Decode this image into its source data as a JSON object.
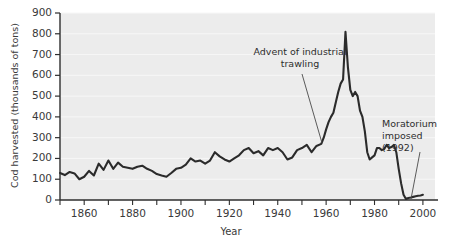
{
  "chart_data": {
    "type": "line",
    "title": "",
    "xlabel": "Year",
    "ylabel": "Cod harvested (thousands of tons)",
    "xlim": [
      1850,
      2005
    ],
    "ylim": [
      0,
      900
    ],
    "ytick_labels": [
      "0",
      "100",
      "200",
      "300",
      "400",
      "500",
      "600",
      "700",
      "800",
      "900"
    ],
    "ytick_values": [
      0,
      100,
      200,
      300,
      400,
      500,
      600,
      700,
      800,
      900
    ],
    "xtick_labels": [
      "1860",
      "1880",
      "1900",
      "1920",
      "1940",
      "1960",
      "1980",
      "2000"
    ],
    "xtick_values": [
      1860,
      1880,
      1900,
      1920,
      1940,
      1960,
      1980,
      2000
    ],
    "xminor_step": 10,
    "grid": "horizontal-faint",
    "legend": "none",
    "line_color": "#2b2b2b",
    "background_color": "#ececec",
    "gridline_color": "#f7f7f7",
    "annotations": [
      {
        "id": "advent-of-industrial-trawling",
        "text_line1": "Advent of industrial",
        "text_line2": "trawling",
        "points_to_year": 1955,
        "points_to_value": 210
      },
      {
        "id": "moratorium-imposed",
        "text_line1": "Moratorium",
        "text_line2": "imposed",
        "text_line3": "(1992)",
        "points_to_year": 1992,
        "points_to_value": 0
      }
    ],
    "series": [
      {
        "name": "Cod harvested",
        "x": [
          1850,
          1852,
          1854,
          1856,
          1858,
          1860,
          1862,
          1864,
          1866,
          1868,
          1870,
          1872,
          1874,
          1876,
          1878,
          1880,
          1882,
          1884,
          1886,
          1888,
          1890,
          1892,
          1894,
          1896,
          1898,
          1900,
          1902,
          1904,
          1906,
          1908,
          1910,
          1912,
          1914,
          1916,
          1918,
          1920,
          1922,
          1924,
          1926,
          1928,
          1930,
          1932,
          1934,
          1936,
          1938,
          1940,
          1942,
          1944,
          1946,
          1948,
          1950,
          1952,
          1954,
          1956,
          1958,
          1959,
          1960,
          1961,
          1962,
          1963,
          1964,
          1965,
          1966,
          1967,
          1968,
          1969,
          1970,
          1971,
          1972,
          1973,
          1974,
          1975,
          1976,
          1977,
          1978,
          1979,
          1980,
          1981,
          1982,
          1983,
          1984,
          1985,
          1986,
          1987,
          1988,
          1989,
          1990,
          1991,
          1992,
          1993,
          1994,
          1995,
          1996,
          1997,
          1998,
          1999,
          2000
        ],
        "values": [
          130,
          120,
          135,
          128,
          100,
          112,
          140,
          118,
          175,
          145,
          190,
          150,
          180,
          160,
          155,
          150,
          160,
          165,
          150,
          140,
          125,
          118,
          112,
          130,
          150,
          155,
          170,
          200,
          185,
          190,
          175,
          190,
          230,
          210,
          195,
          185,
          200,
          215,
          240,
          250,
          225,
          235,
          215,
          250,
          240,
          250,
          230,
          195,
          205,
          240,
          250,
          265,
          230,
          260,
          270,
          300,
          340,
          375,
          400,
          420,
          470,
          520,
          560,
          580,
          810,
          640,
          530,
          500,
          520,
          500,
          430,
          400,
          330,
          230,
          195,
          205,
          215,
          250,
          250,
          240,
          245,
          265,
          250,
          255,
          265,
          230,
          150,
          80,
          25,
          5,
          10,
          12,
          15,
          18,
          20,
          22,
          25
        ]
      }
    ]
  }
}
